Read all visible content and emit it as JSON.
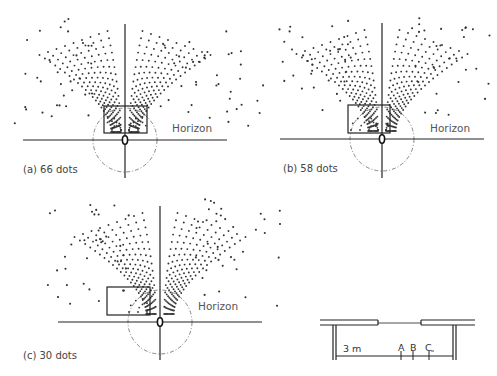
{
  "figure": {
    "panels": [
      {
        "id": "a",
        "caption": "(a) 66 dots",
        "horizon_label": "Horizon",
        "dot_count": 66,
        "axis_x": 125,
        "horizon_y": 140,
        "axis_top": 24,
        "axis_bottom": 178,
        "box": {
          "x": 104,
          "y": 106,
          "w": 43,
          "h": 27
        },
        "circle_r": 32,
        "seed": 11,
        "spread": 1.0
      },
      {
        "id": "b",
        "caption": "(b) 58 dots",
        "horizon_label": "Horizon",
        "dot_count": 58,
        "axis_x": 382,
        "horizon_y": 139,
        "axis_top": 23,
        "axis_bottom": 178,
        "box": {
          "x": 348,
          "y": 105,
          "w": 42,
          "h": 28
        },
        "circle_r": 32,
        "seed": 23,
        "spread": 1.0
      },
      {
        "id": "c",
        "caption": "(c) 30 dots",
        "horizon_label": "Horizon",
        "dot_count": 30,
        "axis_x": 160,
        "horizon_y": 322,
        "axis_top": 206,
        "axis_bottom": 360,
        "box": {
          "x": 107,
          "y": 287,
          "w": 43,
          "h": 28
        },
        "circle_r": 32,
        "seed": 37,
        "spread": 1.0
      }
    ],
    "plan": {
      "distance_label": "3 m",
      "markers": [
        "A",
        "B",
        "C"
      ]
    }
  }
}
